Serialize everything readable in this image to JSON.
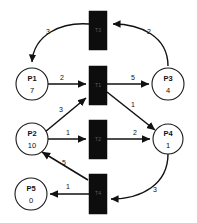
{
  "diagram": {
    "type": "petri-net",
    "background_color": "#ffffff",
    "stroke_color": "#111111",
    "transition_fill": "#0d0d0d",
    "places": [
      {
        "id": "P1",
        "label": "P1",
        "tokens": "7",
        "cx": 32,
        "cy": 84,
        "r": 16
      },
      {
        "id": "P2",
        "label": "P2",
        "tokens": "10",
        "cx": 32,
        "cy": 139,
        "r": 16
      },
      {
        "id": "P3",
        "label": "P3",
        "tokens": "4",
        "cx": 168,
        "cy": 84,
        "r": 16
      },
      {
        "id": "P4",
        "label": "P4",
        "tokens": "1",
        "cx": 168,
        "cy": 139,
        "r": 15
      },
      {
        "id": "P5",
        "label": "P5",
        "tokens": "0",
        "cx": 31,
        "cy": 194,
        "r": 16
      }
    ],
    "transitions": [
      {
        "id": "T3",
        "label": "T3",
        "x": 89,
        "y": 11,
        "w": 18,
        "h": 39
      },
      {
        "id": "T1",
        "label": "T1",
        "x": 89,
        "y": 66,
        "w": 18,
        "h": 39
      },
      {
        "id": "T2",
        "label": "T2",
        "x": 89,
        "y": 120,
        "w": 18,
        "h": 39
      },
      {
        "id": "T4",
        "label": "T4",
        "x": 89,
        "y": 174,
        "w": 18,
        "h": 40
      }
    ],
    "arcs": [
      {
        "id": "T3-P1",
        "from": "T3",
        "to": "P1",
        "weight": "3",
        "lx": 48,
        "ly": 32
      },
      {
        "id": "P3-T3",
        "from": "P3",
        "to": "T3",
        "weight": "2",
        "lx": 149,
        "ly": 32
      },
      {
        "id": "P1-T1",
        "from": "P1",
        "to": "T1",
        "weight": "2",
        "lx": 62,
        "ly": 78
      },
      {
        "id": "T1-P3",
        "from": "T1",
        "to": "P3",
        "weight": "5",
        "lx": 133,
        "ly": 78
      },
      {
        "id": "T1-P4",
        "from": "T1",
        "to": "P4",
        "weight": "1",
        "lx": 133,
        "ly": 105
      },
      {
        "id": "P2-T1",
        "from": "P2",
        "to": "T1",
        "weight": "3",
        "lx": 61,
        "ly": 110
      },
      {
        "id": "P2-T2",
        "from": "P2",
        "to": "T2",
        "weight": "1",
        "lx": 68,
        "ly": 133
      },
      {
        "id": "T2-P4",
        "from": "T2",
        "to": "P4",
        "weight": "2",
        "lx": 135,
        "ly": 133
      },
      {
        "id": "T4-P2",
        "from": "T4",
        "to": "P2",
        "weight": "5",
        "lx": 64,
        "ly": 163
      },
      {
        "id": "T4-P5",
        "from": "T4",
        "to": "P5",
        "weight": "1",
        "lx": 68,
        "ly": 187
      },
      {
        "id": "P4-T4",
        "from": "P4",
        "to": "T4",
        "weight": "3",
        "lx": 155,
        "ly": 190
      }
    ]
  }
}
